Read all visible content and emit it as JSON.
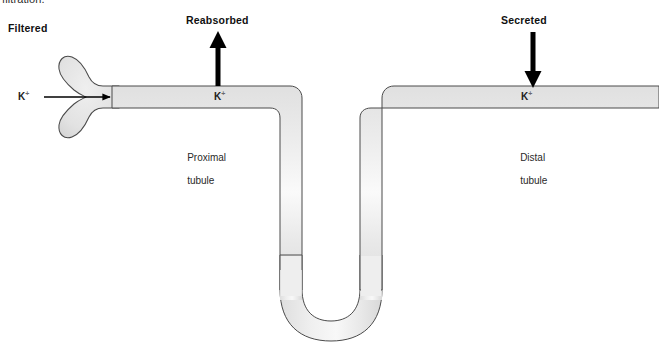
{
  "figure": {
    "cropped_caption_line": "filtration.",
    "background_color": "#ffffff"
  },
  "colors": {
    "tubule_fill": "#e4e4e4",
    "tubule_fill_light": "#f2f2f2",
    "tubule_outline": "#4a4a4a",
    "arrow": "#000000",
    "label_text": "#111111",
    "secondary_text": "#2a2a2a"
  },
  "labels": {
    "filtered": "Filtered",
    "reabsorbed": "Reabsorbed",
    "secreted": "Secreted",
    "proximal_tubule_line1": "Proximal",
    "proximal_tubule_line2": "tubule",
    "distal_tubule_line1": "Distal",
    "distal_tubule_line2": "tubule"
  },
  "ions": {
    "symbol": "K",
    "charge": "+",
    "filtered_label": "K",
    "proximal_label": "K",
    "distal_label": "K"
  },
  "arrows": [
    {
      "name": "filtration-arrow",
      "direction": "right",
      "label": "Filtered",
      "ion": "K+",
      "from": [
        44,
        97
      ],
      "to": [
        115,
        97
      ]
    },
    {
      "name": "reabsorption-arrow",
      "direction": "up",
      "label": "Reabsorbed",
      "ion": "K+",
      "from": [
        218,
        86
      ],
      "to": [
        218,
        33
      ]
    },
    {
      "name": "secretion-arrow",
      "direction": "down",
      "label": "Secreted",
      "ion": "K+",
      "from": [
        533,
        33
      ],
      "to": [
        533,
        88
      ]
    }
  ],
  "structures": [
    {
      "name": "bowmans-capsule",
      "label": "",
      "region": "left glomerular capsule, bilobed cup"
    },
    {
      "name": "proximal-tubule",
      "label": "Proximal tubule",
      "region": "upper-left horizontal segment"
    },
    {
      "name": "loop-of-henle",
      "label": "",
      "region": "descending limb, U-bend, ascending limb"
    },
    {
      "name": "distal-tubule",
      "label": "Distal tubule",
      "region": "upper-right horizontal segment"
    }
  ]
}
